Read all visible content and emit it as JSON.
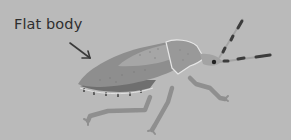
{
  "diagram": {
    "label": "Flat body",
    "pointer": "arrow-icon",
    "colors": {
      "background": "#bababa",
      "label_text": "#2f2f2f",
      "arrow": "#3a3a3a",
      "wing_light": "#a2a2a2",
      "wing_dark": "#8e8e8e",
      "abdomen_edge": "#6f6f6f",
      "pronotum": "#999999",
      "outline_highlight": "#e6e6e6",
      "legs": "#8f8f8f",
      "antenna_segment": "#3c3c3c",
      "eye": "#222222"
    }
  }
}
